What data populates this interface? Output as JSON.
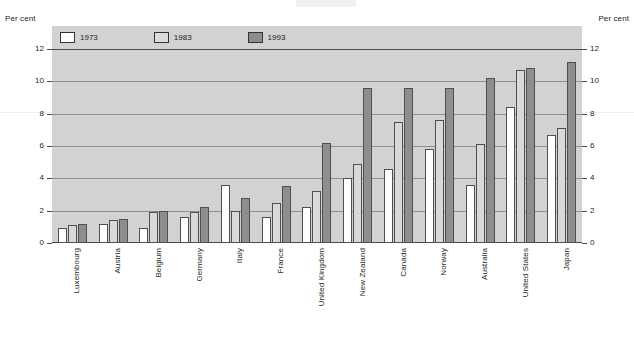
{
  "axis": {
    "unit_label_left": "Per cent",
    "unit_label_right": "Per cent",
    "ticks": [
      "12",
      "10",
      "8",
      "6",
      "4",
      "2",
      "0"
    ]
  },
  "legend": [
    {
      "label": "1973",
      "color": "#ffffff",
      "name": "legend-1973"
    },
    {
      "label": "1983",
      "color": "#dcdcdc",
      "name": "legend-1983"
    },
    {
      "label": "1993",
      "color": "#8d8d8d",
      "name": "legend-1993"
    }
  ],
  "categories": [
    "Luxembourg",
    "Austria",
    "Belgium",
    "Germany",
    "Italy",
    "France",
    "United Kingdom",
    "New Zealand",
    "Canada",
    "Norway",
    "Australia",
    "United States",
    "Japan"
  ],
  "chart_data": {
    "type": "bar",
    "title": "",
    "xlabel": "",
    "ylabel": "Per cent",
    "ylim": [
      0,
      12
    ],
    "yticks": [
      0,
      2,
      4,
      6,
      8,
      10,
      12
    ],
    "grid": true,
    "legend_position": "top-left",
    "categories": [
      "Luxembourg",
      "Austria",
      "Belgium",
      "Germany",
      "Italy",
      "France",
      "United Kingdom",
      "New Zealand",
      "Canada",
      "Norway",
      "Australia",
      "United States",
      "Japan"
    ],
    "series": [
      {
        "name": "1973",
        "color": "#ffffff",
        "values": [
          0.9,
          1.2,
          0.9,
          1.6,
          3.6,
          1.6,
          2.2,
          4.0,
          4.6,
          5.8,
          3.6,
          8.4,
          6.7
        ]
      },
      {
        "name": "1983",
        "color": "#dcdcdc",
        "values": [
          1.1,
          1.4,
          1.9,
          1.9,
          2.0,
          2.5,
          3.2,
          4.9,
          7.5,
          7.6,
          6.1,
          10.7,
          7.1
        ]
      },
      {
        "name": "1993",
        "color": "#8d8d8d",
        "values": [
          1.2,
          1.5,
          2.0,
          2.2,
          2.8,
          3.5,
          6.2,
          9.6,
          9.6,
          9.6,
          10.2,
          10.8,
          11.2
        ]
      }
    ]
  }
}
